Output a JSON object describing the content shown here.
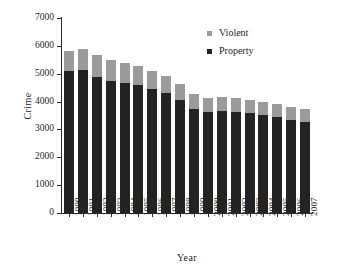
{
  "chart_data": {
    "type": "bar",
    "stacked": true,
    "title": "",
    "xlabel": "Year",
    "ylabel": "Crime",
    "ylim": [
      0,
      7000
    ],
    "ytick_values": [
      0,
      1000,
      2000,
      3000,
      4000,
      5000,
      6000,
      7000
    ],
    "ytick_labels": [
      "0",
      "1000",
      "2000",
      "3000",
      "4000",
      "5000",
      "6000",
      "7000"
    ],
    "grid": false,
    "legend_position": "top-right",
    "categories": [
      "1990",
      "1991",
      "1992",
      "1993",
      "1994",
      "1995",
      "1996",
      "1997",
      "1998",
      "1999",
      "2000",
      "2001",
      "2002",
      "2003",
      "2004",
      "2005",
      "2006",
      "2007"
    ],
    "series": [
      {
        "name": "Property",
        "color": "#232323",
        "values": [
          5090,
          5140,
          4900,
          4740,
          4660,
          4590,
          4450,
          4320,
          4050,
          3740,
          3620,
          3660,
          3630,
          3590,
          3510,
          3430,
          3330,
          3260
        ]
      },
      {
        "name": "Violent",
        "color": "#9b9b9b",
        "values": [
          730,
          760,
          760,
          750,
          720,
          690,
          640,
          610,
          570,
          520,
          510,
          500,
          490,
          480,
          470,
          470,
          470,
          470
        ]
      }
    ],
    "totals": [
      5820,
      5900,
      5660,
      5490,
      5380,
      5280,
      5090,
      4930,
      4620,
      4260,
      4130,
      4160,
      4120,
      4070,
      3980,
      3900,
      3800,
      3730
    ]
  },
  "legend": {
    "items": [
      {
        "label": "Violent",
        "color": "#9b9b9b"
      },
      {
        "label": "Property",
        "color": "#232323"
      }
    ]
  }
}
